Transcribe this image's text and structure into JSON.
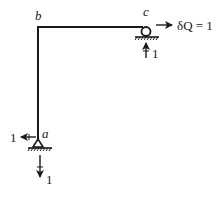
{
  "diagram": {
    "type": "structural-frame",
    "nodes": {
      "a": {
        "label": "a",
        "support": "pin"
      },
      "b": {
        "label": "b",
        "support": "none"
      },
      "c": {
        "label": "c",
        "support": "roller"
      }
    },
    "loads": {
      "c_horizontal": {
        "label": "δQ = 1",
        "direction": "right"
      },
      "c_vertical_reaction": {
        "label": "1",
        "direction": "up"
      },
      "a_horizontal_reaction": {
        "label": "1",
        "direction": "left"
      },
      "a_vertical_reaction": {
        "label": "1",
        "direction": "down"
      }
    },
    "colors": {
      "line": "#1a1a1a",
      "background": "#ffffff"
    }
  }
}
